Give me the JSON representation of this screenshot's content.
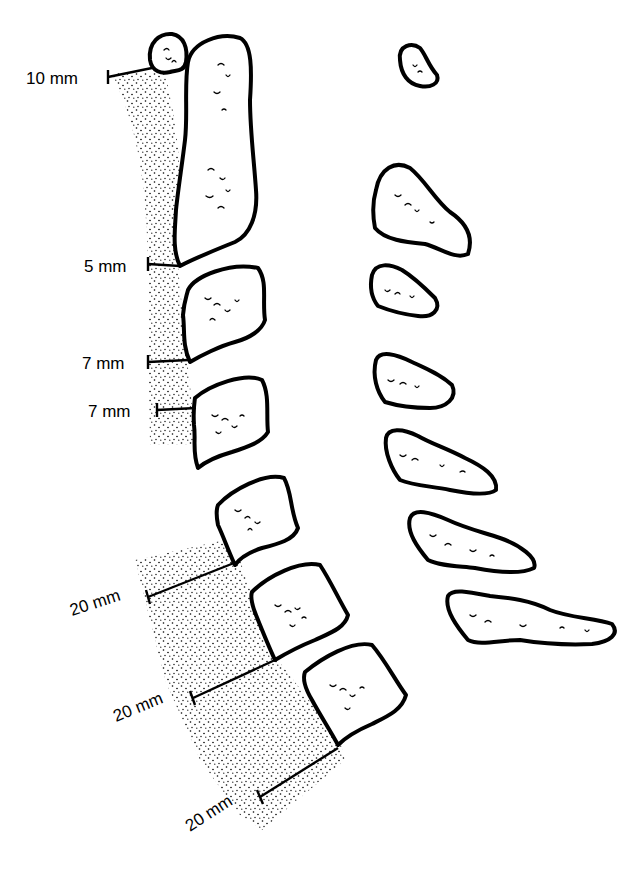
{
  "diagram": {
    "measurements": [
      {
        "level": "C1",
        "label": "10 mm"
      },
      {
        "level": "C2",
        "label": "5 mm"
      },
      {
        "level": "C3",
        "label": "7 mm"
      },
      {
        "level": "C4",
        "label": "7 mm"
      },
      {
        "level": "C5",
        "label": "20 mm"
      },
      {
        "level": "C6",
        "label": "20 mm"
      },
      {
        "level": "C7",
        "label": "20 mm"
      }
    ],
    "vertebral_bodies": [
      "C1 anterior arch",
      "C2 (dens/body)",
      "C3",
      "C4",
      "C5",
      "C6",
      "C7"
    ],
    "spinous_processes": [
      "C1",
      "C2",
      "C3",
      "C4",
      "C5",
      "C6",
      "C7"
    ],
    "colors": {
      "line": "#000000",
      "background": "#ffffff",
      "stipple": "#000000"
    }
  }
}
